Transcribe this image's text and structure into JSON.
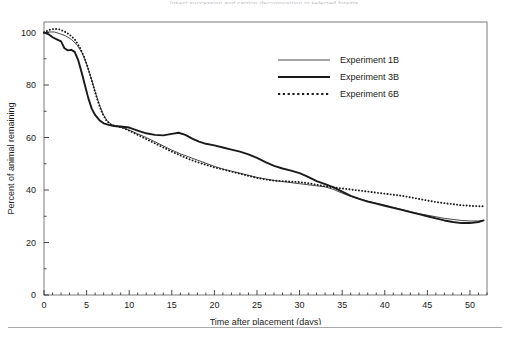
{
  "figure": {
    "header_fragment": "Insect succession and carrion decomposition in selected forests",
    "background_color": "#ffffff",
    "frame_color": "#6e6e72",
    "ink_color": "#1a1a1a"
  },
  "axes": {
    "x": {
      "title": "Time after placement (days)",
      "ticks": [
        0,
        5,
        10,
        15,
        20,
        25,
        30,
        35,
        40,
        45,
        50
      ],
      "min": 0,
      "max": 52,
      "minor_tick_step": 1
    },
    "y": {
      "title": "Percent of animal remaining",
      "ticks": [
        0,
        20,
        40,
        60,
        80,
        100
      ],
      "min": 0,
      "max": 104,
      "minor_tick_step": 10
    }
  },
  "legend": {
    "position": "top-right-inside",
    "items": [
      {
        "label": "Experiment 1B",
        "style": "thin-solid",
        "color": "#1a1a1a",
        "width": 0.8
      },
      {
        "label": "Experiment 3B",
        "style": "thick-solid",
        "color": "#1a1a1a",
        "width": 1.9
      },
      {
        "label": "Experiment 6B",
        "style": "dotted",
        "color": "#1a1a1a",
        "width": 1.9
      }
    ]
  },
  "chart_data": {
    "type": "line",
    "title": "",
    "xlabel": "Time after placement (days)",
    "ylabel": "Percent of animal remaining",
    "xlim": [
      0,
      52
    ],
    "ylim": [
      0,
      104
    ],
    "grid": false,
    "legend_position": "top-right-inside",
    "series": [
      {
        "name": "Experiment 1B",
        "style": "thin-solid",
        "points": [
          [
            0,
            100
          ],
          [
            0.6,
            100.2
          ],
          [
            1.2,
            100.2
          ],
          [
            1.8,
            99.6
          ],
          [
            2.5,
            98.8
          ],
          [
            3.2,
            97.4
          ],
          [
            3.9,
            95.2
          ],
          [
            4.5,
            92.0
          ],
          [
            5.0,
            88.0
          ],
          [
            5.5,
            83.0
          ],
          [
            6.0,
            77.5
          ],
          [
            6.5,
            72.5
          ],
          [
            7.0,
            68.5
          ],
          [
            7.5,
            66.0
          ],
          [
            8.0,
            64.8
          ],
          [
            8.6,
            64.2
          ],
          [
            9.3,
            63.6
          ],
          [
            10.0,
            62.8
          ],
          [
            11.0,
            61.4
          ],
          [
            12.0,
            60.0
          ],
          [
            13.0,
            58.4
          ],
          [
            14.0,
            56.8
          ],
          [
            15.0,
            55.2
          ],
          [
            16.0,
            53.8
          ],
          [
            17.0,
            52.6
          ],
          [
            18.0,
            51.4
          ],
          [
            19.0,
            50.2
          ],
          [
            20.0,
            49.0
          ],
          [
            21.0,
            48.0
          ],
          [
            22.0,
            47.2
          ],
          [
            23.0,
            46.4
          ],
          [
            24.0,
            45.6
          ],
          [
            25.0,
            44.8
          ],
          [
            26.0,
            44.2
          ],
          [
            27.0,
            43.6
          ],
          [
            28.0,
            43.2
          ],
          [
            29.0,
            42.8
          ],
          [
            30.0,
            42.4
          ],
          [
            31.0,
            42.0
          ],
          [
            32.0,
            41.6
          ],
          [
            33.0,
            41.2
          ],
          [
            34.0,
            40.2
          ],
          [
            35.0,
            38.8
          ],
          [
            36.0,
            37.6
          ],
          [
            37.0,
            36.6
          ],
          [
            38.0,
            35.8
          ],
          [
            39.0,
            35.0
          ],
          [
            40.0,
            34.2
          ],
          [
            41.0,
            33.4
          ],
          [
            42.0,
            32.6
          ],
          [
            43.0,
            31.8
          ],
          [
            44.0,
            31.0
          ],
          [
            45.0,
            30.4
          ],
          [
            46.0,
            29.8
          ],
          [
            47.0,
            29.2
          ],
          [
            48.0,
            28.8
          ],
          [
            49.0,
            28.4
          ],
          [
            50.0,
            28.2
          ],
          [
            51.0,
            28.2
          ],
          [
            51.6,
            28.4
          ]
        ]
      },
      {
        "name": "Experiment 3B",
        "style": "thick-solid",
        "points": [
          [
            0,
            100
          ],
          [
            0.5,
            99.4
          ],
          [
            1.0,
            98.2
          ],
          [
            1.5,
            97.4
          ],
          [
            2.0,
            96.6
          ],
          [
            2.4,
            94.0
          ],
          [
            2.8,
            93.2
          ],
          [
            3.2,
            93.4
          ],
          [
            3.6,
            92.6
          ],
          [
            4.0,
            89.6
          ],
          [
            4.4,
            85.0
          ],
          [
            4.8,
            80.0
          ],
          [
            5.2,
            75.0
          ],
          [
            5.6,
            71.0
          ],
          [
            6.0,
            68.6
          ],
          [
            6.5,
            66.6
          ],
          [
            7.0,
            65.4
          ],
          [
            7.6,
            64.8
          ],
          [
            8.2,
            64.4
          ],
          [
            9.0,
            64.2
          ],
          [
            10.0,
            63.8
          ],
          [
            11.0,
            62.6
          ],
          [
            12.0,
            61.6
          ],
          [
            13.0,
            61.0
          ],
          [
            14.0,
            60.8
          ],
          [
            15.0,
            61.4
          ],
          [
            15.8,
            61.8
          ],
          [
            16.6,
            61.0
          ],
          [
            17.4,
            59.6
          ],
          [
            18.2,
            58.4
          ],
          [
            19.0,
            57.6
          ],
          [
            20.0,
            57.0
          ],
          [
            21.0,
            56.2
          ],
          [
            22.0,
            55.4
          ],
          [
            23.0,
            54.6
          ],
          [
            24.0,
            53.6
          ],
          [
            25.0,
            52.2
          ],
          [
            26.0,
            50.6
          ],
          [
            27.0,
            49.2
          ],
          [
            28.0,
            48.2
          ],
          [
            29.0,
            47.4
          ],
          [
            30.0,
            46.4
          ],
          [
            31.0,
            45.0
          ],
          [
            32.0,
            43.4
          ],
          [
            33.0,
            42.2
          ],
          [
            34.0,
            41.0
          ],
          [
            35.0,
            39.4
          ],
          [
            36.0,
            37.8
          ],
          [
            37.0,
            36.6
          ],
          [
            38.0,
            35.6
          ],
          [
            39.0,
            34.8
          ],
          [
            40.0,
            34.0
          ],
          [
            41.0,
            33.2
          ],
          [
            42.0,
            32.4
          ],
          [
            43.0,
            31.6
          ],
          [
            44.0,
            30.8
          ],
          [
            45.0,
            30.0
          ],
          [
            46.0,
            29.2
          ],
          [
            47.0,
            28.4
          ],
          [
            48.0,
            27.8
          ],
          [
            49.0,
            27.4
          ],
          [
            50.0,
            27.4
          ],
          [
            51.0,
            27.8
          ],
          [
            51.6,
            28.4
          ]
        ]
      },
      {
        "name": "Experiment 6B",
        "style": "dotted",
        "points": [
          [
            0,
            100
          ],
          [
            0.6,
            101.0
          ],
          [
            1.2,
            101.4
          ],
          [
            1.8,
            101.2
          ],
          [
            2.4,
            100.4
          ],
          [
            3.0,
            99.2
          ],
          [
            3.6,
            97.4
          ],
          [
            4.2,
            94.4
          ],
          [
            4.8,
            90.0
          ],
          [
            5.3,
            85.0
          ],
          [
            5.8,
            79.5
          ],
          [
            6.3,
            74.0
          ],
          [
            6.8,
            69.5
          ],
          [
            7.3,
            66.6
          ],
          [
            7.8,
            65.0
          ],
          [
            8.4,
            64.4
          ],
          [
            9.2,
            63.8
          ],
          [
            10.0,
            62.6
          ],
          [
            11.0,
            61.0
          ],
          [
            12.0,
            59.4
          ],
          [
            13.0,
            57.8
          ],
          [
            14.0,
            56.2
          ],
          [
            15.0,
            54.6
          ],
          [
            16.0,
            53.2
          ],
          [
            17.0,
            51.8
          ],
          [
            18.0,
            50.6
          ],
          [
            19.0,
            49.6
          ],
          [
            20.0,
            48.6
          ],
          [
            21.0,
            47.8
          ],
          [
            22.0,
            47.0
          ],
          [
            23.0,
            46.2
          ],
          [
            24.0,
            45.4
          ],
          [
            25.0,
            44.6
          ],
          [
            26.0,
            44.0
          ],
          [
            27.0,
            43.6
          ],
          [
            28.0,
            43.4
          ],
          [
            29.0,
            43.2
          ],
          [
            30.0,
            43.0
          ],
          [
            31.0,
            42.6
          ],
          [
            32.0,
            42.0
          ],
          [
            33.0,
            41.4
          ],
          [
            34.0,
            41.0
          ],
          [
            35.0,
            40.6
          ],
          [
            36.0,
            40.2
          ],
          [
            37.0,
            39.8
          ],
          [
            38.0,
            39.4
          ],
          [
            39.0,
            39.0
          ],
          [
            40.0,
            38.6
          ],
          [
            41.0,
            38.2
          ],
          [
            42.0,
            37.8
          ],
          [
            43.0,
            37.2
          ],
          [
            44.0,
            36.6
          ],
          [
            45.0,
            36.0
          ],
          [
            46.0,
            35.4
          ],
          [
            47.0,
            35.0
          ],
          [
            48.0,
            34.6
          ],
          [
            49.0,
            34.2
          ],
          [
            50.0,
            34.0
          ],
          [
            51.0,
            33.8
          ],
          [
            51.6,
            33.8
          ]
        ]
      }
    ]
  }
}
